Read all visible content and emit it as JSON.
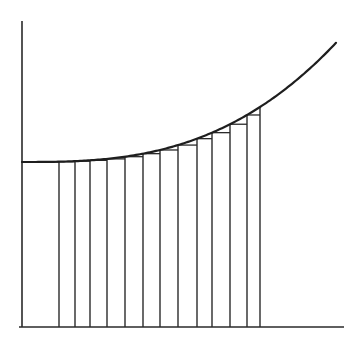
{
  "diagram": {
    "colors": {
      "background": "#ffffff",
      "ink": "#2a2a2a",
      "curve": "#1e1e1e"
    },
    "y_axis": {
      "x": 22,
      "top": 21,
      "bottom": 327
    },
    "x_axis": {
      "y": 327,
      "left": 19,
      "right": 344
    },
    "curve": {
      "start": [
        22,
        162
      ],
      "end": [
        336,
        43
      ],
      "model": {
        "base_y": 162,
        "x0": 22,
        "exponent": 2.79,
        "ref_x": 260,
        "ref_drop": 55
      }
    },
    "partition_x": [
      22,
      59,
      75,
      90,
      107,
      125,
      143,
      160,
      178,
      197,
      212,
      230,
      247,
      260
    ],
    "rectangle_count": 13
  }
}
